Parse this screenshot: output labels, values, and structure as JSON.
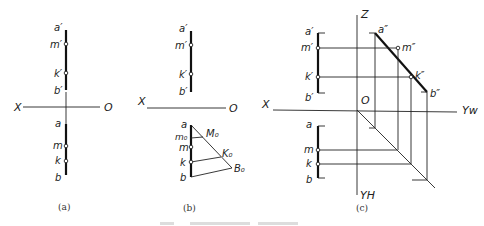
{
  "figure": {
    "caption_partial": "图 (faded / cut off)",
    "panels": [
      {
        "id": "a",
        "caption": "(a)",
        "axis_labels": {
          "x": "X",
          "o": "O"
        },
        "front_labels": [
          "a′",
          "m′",
          "k′",
          "b′"
        ],
        "top_labels": [
          "a",
          "m",
          "k",
          "b"
        ]
      },
      {
        "id": "b",
        "caption": "(b)",
        "axis_labels": {
          "x": "X",
          "o": "O"
        },
        "front_labels": [
          "a′",
          "m′",
          "k′",
          "b′"
        ],
        "top_labels": [
          "a",
          "m₀",
          "m",
          "k",
          "b"
        ],
        "construction_labels": [
          "M₀",
          "K₀",
          "B₀"
        ]
      },
      {
        "id": "c",
        "caption": "(c)",
        "axis_labels": {
          "x": "X",
          "o": "O",
          "z": "Z",
          "yw": "Yw",
          "yh": "YH"
        },
        "front_labels": [
          "a′",
          "m′",
          "k′",
          "b′"
        ],
        "side_labels": [
          "a″",
          "m″",
          "k″",
          "b″"
        ],
        "top_labels": [
          "a",
          "m",
          "k",
          "b"
        ]
      }
    ]
  }
}
